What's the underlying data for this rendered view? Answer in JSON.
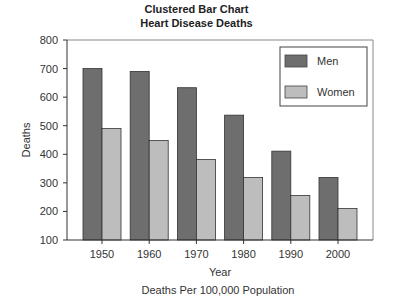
{
  "chart_data": {
    "type": "bar",
    "title": "Clustered Bar Chart",
    "subtitle": "Heart Disease Deaths",
    "xlabel": "Year",
    "ylabel": "Deaths",
    "caption": "Deaths Per 100,000 Population",
    "categories": [
      "1950",
      "1960",
      "1970",
      "1980",
      "1990",
      "2000"
    ],
    "series": [
      {
        "name": "Men",
        "color": "#6e6e6e",
        "values": [
          700,
          690,
          633,
          537,
          411,
          319
        ]
      },
      {
        "name": "Women",
        "color": "#bdbdbd",
        "values": [
          490,
          448,
          382,
          319,
          256,
          210
        ]
      }
    ],
    "ylim": [
      100,
      800
    ],
    "yticks": [
      "100",
      "200",
      "300",
      "400",
      "500",
      "600",
      "700",
      "800"
    ],
    "grid": false,
    "legend_position": "top-right inside"
  }
}
